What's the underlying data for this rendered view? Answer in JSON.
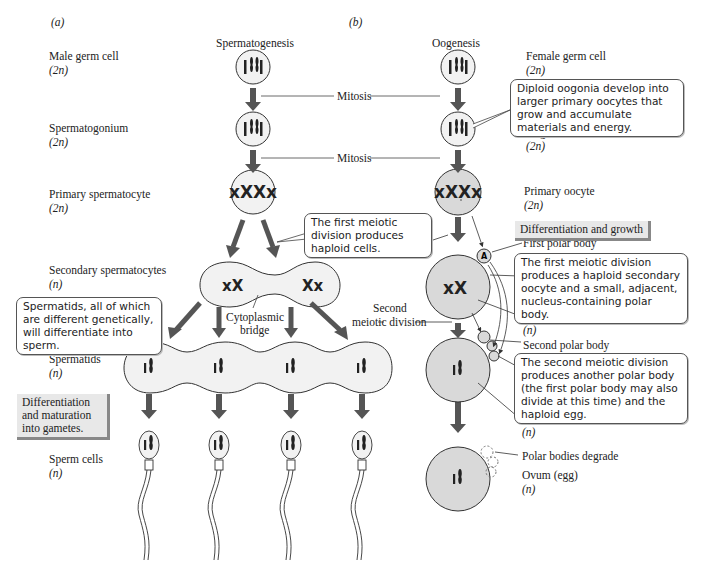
{
  "panels": {
    "a": "(a)",
    "b": "(b)"
  },
  "columns": {
    "left_title": "Spermatogenesis",
    "right_title": "Oogenesis"
  },
  "left_labels": [
    {
      "name": "Male germ cell",
      "ploidy": "(2n)"
    },
    {
      "name": "Spermatogonium",
      "ploidy": "(2n)"
    },
    {
      "name": "Primary spermatocyte",
      "ploidy": "(2n)"
    },
    {
      "name": "Secondary spermatocytes",
      "ploidy": "(n)"
    },
    {
      "name": "Spermatids",
      "ploidy": "(n)"
    },
    {
      "name": "Sperm cells",
      "ploidy": "(n)"
    }
  ],
  "right_labels": [
    {
      "name": "Female germ cell",
      "ploidy": "(2n)"
    },
    {
      "name": "Oogonium",
      "ploidy": "(2n)"
    },
    {
      "name": "Primary oocyte",
      "ploidy": "(2n)"
    },
    {
      "name": "First polar body"
    },
    {
      "name": "Secondary oocyte",
      "ploidy": "(n)"
    },
    {
      "name": "Second polar body"
    },
    {
      "name": "Ootid",
      "ploidy": "(n)"
    },
    {
      "name": "Polar bodies degrade"
    },
    {
      "name": "Ovum (egg)",
      "ploidy": "(n)"
    }
  ],
  "process_labels": {
    "mitosis_1": "Mitosis",
    "mitosis_2": "Mitosis",
    "cytoplasmic_bridge_line1": "Cytoplasmic",
    "cytoplasmic_bridge_line2": "bridge",
    "second_meiotic_line1": "Second",
    "second_meiotic_line2": "meiotic division"
  },
  "callouts": {
    "oogonia": "Diploid oogonia develop into larger primary oocytes that grow and accumulate materials and energy.",
    "first_meiotic": "The first meiotic division produces haploid cells.",
    "spermatids": "Spermatids, all of which are different genetically, will differentiate into sperm.",
    "first_meiotic_oocyte": "The first meiotic division produces a haploid secondary oocyte and a small, adjacent, nucleus-containing polar body.",
    "second_meiotic": "The second meiotic division produces another polar body (the first polar body may also divide at this time) and the haploid egg."
  },
  "shaded_labels": {
    "differentiation_growth": "Differentiation and growth",
    "differentiation_maturation": "Differentiation and maturation into gametes."
  },
  "colors": {
    "egg_fill": "#d9d9d9",
    "arrow": "#555555",
    "line": "#444444"
  }
}
